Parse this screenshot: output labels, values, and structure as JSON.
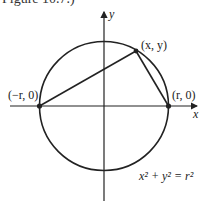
{
  "caption_fragment": "Figure 10.7.)",
  "axes": {
    "x_label": "x",
    "y_label": "y"
  },
  "points": {
    "top": "(x, y)",
    "left": "(−r, 0)",
    "right": "(r, 0)"
  },
  "equation": "x² + y² = r²",
  "colors": {
    "stroke": "#222222"
  }
}
